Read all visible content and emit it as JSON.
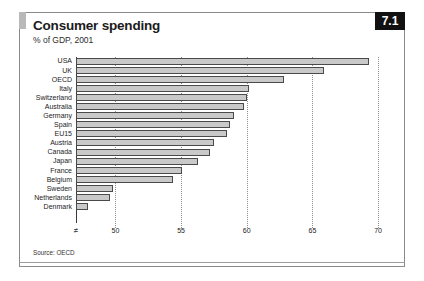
{
  "figure": {
    "badge_number": "7.1",
    "title": "Consumer spending",
    "subtitle": "% of GDP, 2001",
    "source": "Source: OECD",
    "accent_color": "#111111",
    "bar_fill_color": "#c9c9c9",
    "bar_stroke_color": "#4a4a4a",
    "axis_break_symbol": "≠"
  },
  "chart_data": {
    "type": "bar",
    "orientation": "horizontal",
    "title": "Consumer spending",
    "subtitle": "% of GDP, 2001",
    "xlabel": "",
    "ylabel": "",
    "xlim": [
      47,
      70.6
    ],
    "axis_break": true,
    "grid": true,
    "gridlines": "dotted vertical at each x tick",
    "legend": "none",
    "xticks": [
      50,
      55,
      60,
      65,
      70
    ],
    "xtick_labels": [
      "50",
      "55",
      "60",
      "65",
      "70"
    ],
    "categories": [
      "USA",
      "UK",
      "OECD",
      "Italy",
      "Switzerland",
      "Australia",
      "Germany",
      "Spain",
      "EU15",
      "Austria",
      "Canada",
      "Japan",
      "France",
      "Belgium",
      "Sweden",
      "Netherlands",
      "Denmark"
    ],
    "values": [
      69.3,
      65.9,
      62.8,
      60.2,
      60.0,
      59.8,
      59.0,
      58.7,
      58.5,
      57.5,
      57.2,
      56.3,
      55.1,
      54.4,
      49.8,
      49.6,
      47.9
    ],
    "source": "Source: OECD"
  }
}
